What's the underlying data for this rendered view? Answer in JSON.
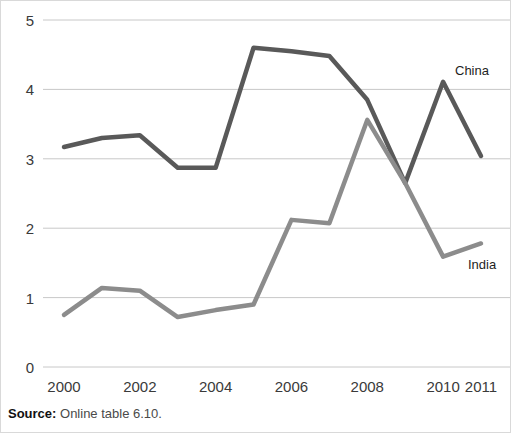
{
  "figure": {
    "source_prefix": "Source:",
    "source_text": " Online table 6.10."
  },
  "chart_data": {
    "type": "line",
    "title": "",
    "subtitle": "",
    "xlabel": "",
    "ylabel": "",
    "x": [
      2000,
      2001,
      2002,
      2003,
      2004,
      2005,
      2006,
      2007,
      2008,
      2009,
      2010,
      2011
    ],
    "x_tick_labels": [
      "2000",
      "2002",
      "2004",
      "2006",
      "2008",
      "2010",
      "2011"
    ],
    "x_tick_values": [
      2000,
      2002,
      2004,
      2006,
      2008,
      2010,
      2011
    ],
    "y_tick_labels": [
      "0",
      "1",
      "2",
      "3",
      "4",
      "5"
    ],
    "y_tick_values": [
      0,
      1,
      2,
      3,
      4,
      5
    ],
    "ylim": [
      0,
      5
    ],
    "xlim": [
      2000,
      2011
    ],
    "grid": true,
    "grid_axis": "y",
    "legend": "inline-end-labels",
    "series": [
      {
        "name": "China",
        "color": "#595959",
        "label_position": {
          "x": 455,
          "y": 64
        },
        "values": [
          3.17,
          3.3,
          3.34,
          2.87,
          2.87,
          4.6,
          4.55,
          4.48,
          3.85,
          2.65,
          4.11,
          3.04
        ]
      },
      {
        "name": "India",
        "color": "#8c8c8c",
        "label_position": {
          "x": 468,
          "y": 258
        },
        "values": [
          0.75,
          1.14,
          1.1,
          0.72,
          0.82,
          0.9,
          2.12,
          2.07,
          3.56,
          2.65,
          1.59,
          1.78
        ]
      }
    ]
  }
}
